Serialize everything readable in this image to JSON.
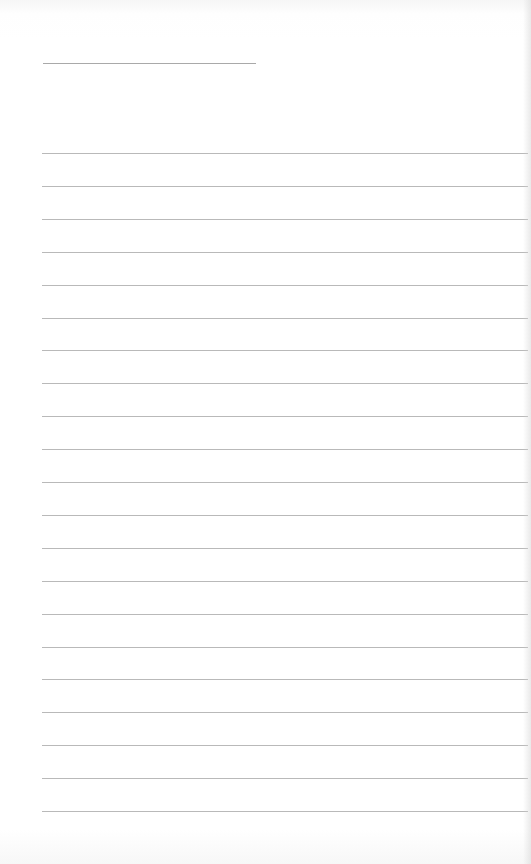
{
  "page": {
    "type": "lined-paper",
    "background": "#ffffff",
    "line_color": "#a8a8a8"
  },
  "header_line": {
    "left": 43,
    "top": 63,
    "width": 213,
    "text": ""
  },
  "ruled_lines": {
    "left": 42,
    "right_edge": 528,
    "first_top": 153,
    "spacing": 32.9,
    "count": 21,
    "lines": [
      "",
      "",
      "",
      "",
      "",
      "",
      "",
      "",
      "",
      "",
      "",
      "",
      "",
      "",
      "",
      "",
      "",
      "",
      "",
      "",
      ""
    ]
  }
}
